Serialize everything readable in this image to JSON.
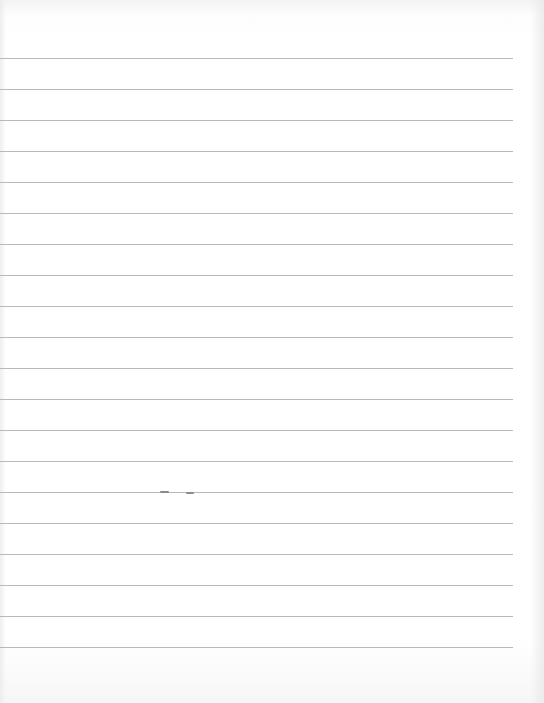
{
  "paper": {
    "type": "lined-paper",
    "background": "#ffffff",
    "line_color": "#b9b9b9",
    "line_count": 20,
    "line_right_edge": 513,
    "line_y_positions": [
      58,
      89,
      120,
      151,
      182,
      213,
      244,
      275,
      306,
      337,
      368,
      399,
      430,
      461,
      492,
      523,
      554,
      585,
      616,
      647
    ],
    "content": ""
  },
  "marks": [
    {
      "x": 160,
      "y": 492,
      "w": 9
    },
    {
      "x": 186,
      "y": 493,
      "w": 8
    }
  ]
}
